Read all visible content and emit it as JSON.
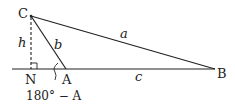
{
  "diagram": {
    "type": "oblique triangle with altitude",
    "points": {
      "C": {
        "label": "C",
        "x": 31,
        "y": 16
      },
      "N": {
        "label": "N",
        "x": 31,
        "y": 69
      },
      "A": {
        "label": "A",
        "x": 66,
        "y": 69
      },
      "B": {
        "label": "B",
        "x": 215,
        "y": 69
      }
    },
    "sides": {
      "a": {
        "label": "a",
        "from": "C",
        "to": "B"
      },
      "b": {
        "label": "b",
        "from": "C",
        "to": "A"
      },
      "c": {
        "label": "c",
        "from": "A",
        "to": "B"
      }
    },
    "altitude": {
      "label": "h",
      "from": "C",
      "to": "N",
      "style": "dashed"
    },
    "angle_label": "180° − A",
    "colors": {
      "stroke": "#222222",
      "background": "#ffffff"
    }
  }
}
